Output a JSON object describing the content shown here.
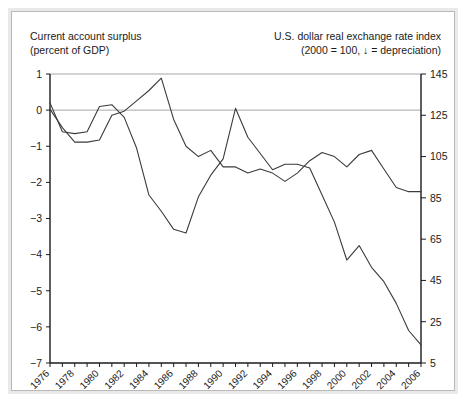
{
  "figure": {
    "left_axis_title": "Current account surplus\n(percent of GDP)",
    "right_axis_title": "U.S. dollar real exchange rate index\n(2000  = 100, ↓ = depreciation)"
  },
  "chart_data": {
    "type": "line",
    "title": "",
    "subtitle": "",
    "xlabel": "",
    "ylabel": "Current account surplus (percent of GDP)",
    "y2label": "U.S. dollar real exchange rate index (2000  = 100, ↓ = depreciation)",
    "grid": true,
    "legend_position": "none",
    "xlim": [
      1976,
      2006
    ],
    "ylim": [
      -7,
      1
    ],
    "y2lim": [
      5,
      145
    ],
    "yticks": [
      1,
      0,
      -1,
      -2,
      -3,
      -4,
      -5,
      -6,
      -7
    ],
    "ytick_labels": [
      "1",
      "0",
      "−1",
      "−2",
      "−3",
      "−4",
      "−5",
      "−6",
      "−7"
    ],
    "y2ticks": [
      145,
      125,
      105,
      85,
      65,
      45,
      25,
      5
    ],
    "y2tick_labels": [
      "145",
      "125",
      "105",
      "85",
      "65",
      "45",
      "25",
      "5"
    ],
    "x": [
      1976,
      1977,
      1978,
      1979,
      1980,
      1981,
      1982,
      1983,
      1984,
      1985,
      1986,
      1987,
      1988,
      1989,
      1990,
      1991,
      1992,
      1993,
      1994,
      1995,
      1996,
      1997,
      1998,
      1999,
      2000,
      2001,
      2002,
      2003,
      2004,
      2005,
      2006
    ],
    "xticks": [
      1976,
      1977,
      1978,
      1979,
      1980,
      1981,
      1982,
      1983,
      1984,
      1985,
      1986,
      1987,
      1988,
      1989,
      1990,
      1991,
      1992,
      1993,
      1994,
      1995,
      1996,
      1997,
      1998,
      1999,
      2000,
      2001,
      2002,
      2003,
      2004,
      2005,
      2006
    ],
    "xtick_labels": [
      "1976",
      "",
      "1978",
      "",
      "1980",
      "",
      "1982",
      "",
      "1984",
      "",
      "1986",
      "",
      "1988",
      "",
      "1990",
      "",
      "1992",
      "",
      "1994",
      "",
      "1996",
      "",
      "1998",
      "",
      "2000",
      "",
      "2002",
      "",
      "2004",
      "",
      "2006"
    ],
    "series": [
      {
        "name": "Current account surplus (percent of GDP)",
        "axis": "left",
        "unit": "percent of GDP",
        "color": "#3b3b3b",
        "values": [
          0.2,
          -0.6,
          -0.65,
          -0.6,
          0.1,
          0.15,
          -0.2,
          -1.05,
          -2.35,
          -2.8,
          -3.3,
          -3.4,
          -2.4,
          -1.8,
          -1.35,
          0.05,
          -0.75,
          -1.2,
          -1.65,
          -1.5,
          -1.5,
          -1.6,
          -2.35,
          -3.1,
          -4.15,
          -3.75,
          -4.35,
          -4.75,
          -5.35,
          -6.1,
          -6.5
        ]
      },
      {
        "name": "U.S. dollar real exchange rate index",
        "axis": "right",
        "unit": "index, 2000 = 100",
        "color": "#3b3b3b",
        "values": [
          128,
          119,
          112,
          112,
          113,
          125,
          127,
          132,
          137,
          143,
          123,
          110,
          105,
          108,
          100,
          100,
          97,
          99,
          97,
          93,
          97,
          103,
          107,
          105,
          100,
          106,
          108,
          99,
          90,
          88,
          88
        ]
      }
    ]
  }
}
